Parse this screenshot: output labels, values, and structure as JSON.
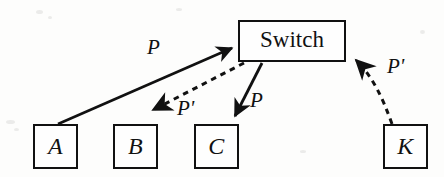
{
  "figure": {
    "type": "node-link-diagram",
    "background_color": "#fdfdfc",
    "stroke_color": "#111111",
    "nodes": {
      "switch": {
        "label": "Switch",
        "x": 238,
        "y": 20,
        "width": 108,
        "height": 42
      },
      "a": {
        "label": "A",
        "x": 33,
        "y": 124,
        "width": 45,
        "height": 45
      },
      "b": {
        "label": "B",
        "x": 113,
        "y": 124,
        "width": 45,
        "height": 45
      },
      "c": {
        "label": "C",
        "x": 194,
        "y": 124,
        "width": 45,
        "height": 45
      },
      "k": {
        "label": "K",
        "x": 383,
        "y": 124,
        "width": 45,
        "height": 45
      }
    },
    "edges": [
      {
        "id": "a-to-switch",
        "from": "A",
        "to": "Switch",
        "label": "P",
        "style": "solid",
        "direction": "up-right"
      },
      {
        "id": "switch-to-b",
        "from": "Switch",
        "to": "B",
        "label": "P'",
        "style": "dashed",
        "direction": "down-left"
      },
      {
        "id": "switch-to-c",
        "from": "Switch",
        "to": "C",
        "label": "P",
        "style": "solid",
        "direction": "down-left"
      },
      {
        "id": "k-to-switch",
        "from": "K",
        "to": "Switch",
        "label": "P'",
        "style": "dashed",
        "direction": "up-left"
      }
    ],
    "labels": {
      "p_a": {
        "text": "P",
        "x": 147,
        "y": 37
      },
      "p_prime_b": {
        "text": "P'",
        "x": 177,
        "y": 98
      },
      "p_c": {
        "text": "P",
        "x": 250,
        "y": 90
      },
      "p_prime_k": {
        "text": "P'",
        "x": 387,
        "y": 56
      }
    }
  }
}
